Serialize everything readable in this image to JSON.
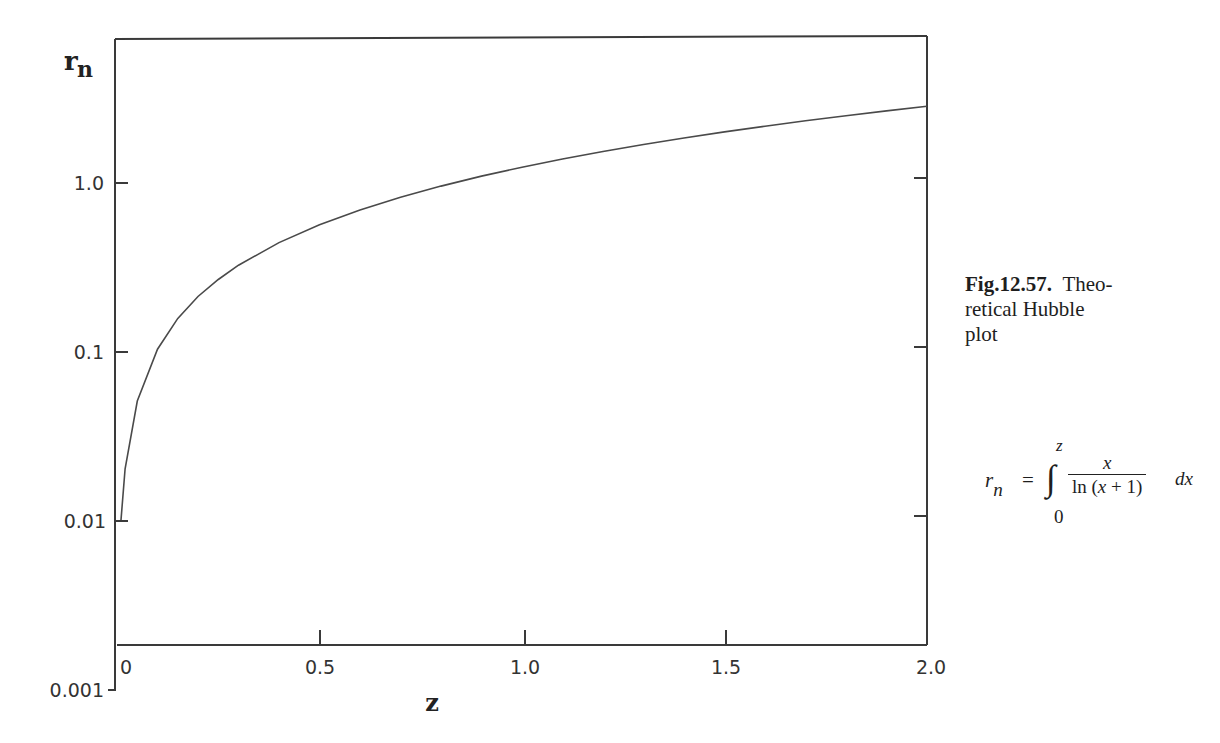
{
  "chart_data": {
    "type": "line",
    "title": "",
    "xlabel": "z",
    "ylabel": "r_n",
    "yscale": "log",
    "xlim": [
      0,
      2.0
    ],
    "ylim": [
      0.001,
      3.5
    ],
    "x_ticks": [
      "0",
      "0.5",
      "1.0",
      "1.5",
      "2.0"
    ],
    "y_ticks": [
      "0.001",
      "0.01",
      "0.1",
      "1.0"
    ],
    "grid": false,
    "legend": null,
    "series": [
      {
        "name": "r_n",
        "x": [
          0.01,
          0.02,
          0.05,
          0.1,
          0.15,
          0.2,
          0.25,
          0.3,
          0.4,
          0.5,
          0.6,
          0.7,
          0.8,
          0.9,
          1.0,
          1.1,
          1.2,
          1.3,
          1.4,
          1.5,
          1.6,
          1.7,
          1.8,
          1.9,
          2.0
        ],
        "y": [
          0.01,
          0.0201,
          0.0506,
          0.1025,
          0.156,
          0.21,
          0.265,
          0.322,
          0.438,
          0.559,
          0.684,
          0.813,
          0.946,
          1.083,
          1.224,
          1.368,
          1.516,
          1.667,
          1.822,
          1.979,
          2.139,
          2.302,
          2.467,
          2.635,
          2.806
        ]
      }
    ]
  },
  "axes": {
    "y_title": "r",
    "y_title_sub": "n",
    "x_title": "z",
    "y_tick_labels": [
      "1.0",
      "0.1",
      "0.01",
      "0.001"
    ],
    "x_tick_labels": [
      "0",
      "0.5",
      "1.0",
      "1.5",
      "2.0"
    ]
  },
  "caption": {
    "fig_number": "Fig.12.57.",
    "text_line1": "Theo-",
    "text_line2": "retical Hubble",
    "text_line3": "plot"
  },
  "formula": {
    "lhs": "r",
    "lhs_sub": "n",
    "equals": "=",
    "integral": "∫",
    "upper_limit": "z",
    "lower_limit": "0",
    "numerator": "x",
    "denominator_pre": "ln (",
    "denominator_var": "x",
    "denominator_post": " + 1)",
    "differential": "dx"
  }
}
